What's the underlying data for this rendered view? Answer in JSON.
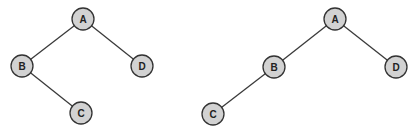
{
  "diagram": {
    "type": "binary-trees",
    "colors": {
      "node_fill": "#d2d2d2",
      "node_stroke": "#333333",
      "edge": "#3a3a3a",
      "label": "#222222"
    },
    "trees": [
      {
        "name": "left-tree",
        "nodes": [
          {
            "id": "A",
            "label": "A",
            "x": 83,
            "y": 19
          },
          {
            "id": "B",
            "label": "B",
            "x": 22,
            "y": 66
          },
          {
            "id": "C",
            "label": "C",
            "x": 81,
            "y": 113
          },
          {
            "id": "D",
            "label": "D",
            "x": 142,
            "y": 66
          }
        ],
        "edges": [
          [
            "A",
            "B"
          ],
          [
            "A",
            "D"
          ],
          [
            "B",
            "C"
          ]
        ]
      },
      {
        "name": "right-tree",
        "nodes": [
          {
            "id": "A",
            "label": "A",
            "x": 335,
            "y": 19
          },
          {
            "id": "B",
            "label": "B",
            "x": 274,
            "y": 67
          },
          {
            "id": "C",
            "label": "C",
            "x": 213,
            "y": 114
          },
          {
            "id": "D",
            "label": "D",
            "x": 396,
            "y": 67
          }
        ],
        "edges": [
          [
            "A",
            "B"
          ],
          [
            "A",
            "D"
          ],
          [
            "B",
            "C"
          ]
        ]
      }
    ]
  }
}
